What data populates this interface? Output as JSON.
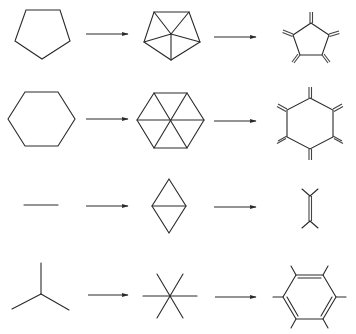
{
  "diagram": {
    "title": "",
    "stroke_color": "#2a2a2a",
    "rows": [
      {
        "label": "pentagon-row",
        "steps": [
          {
            "shape": "regular-pentagon",
            "orientation": "point-down"
          },
          {
            "shape": "pentagon-fan-triangulation",
            "orientation": "point-down",
            "triangles": 5
          },
          {
            "shape": "cyclopentane-pentaone",
            "orientation": "point-up",
            "substituents": 5,
            "substituent_type": "double-bond"
          }
        ]
      },
      {
        "label": "hexagon-row",
        "steps": [
          {
            "shape": "regular-hexagon",
            "orientation": "flat-top"
          },
          {
            "shape": "hexagon-fan-triangulation",
            "orientation": "flat-top",
            "triangles": 6
          },
          {
            "shape": "cyclohexane-hexaone",
            "orientation": "point-up",
            "substituents": 6,
            "substituent_type": "double-bond"
          }
        ]
      },
      {
        "label": "line-row",
        "steps": [
          {
            "shape": "line-segment",
            "orientation": "horizontal"
          },
          {
            "shape": "two-triangles-rhombus",
            "orientation": "vertical",
            "triangles": 2
          },
          {
            "shape": "ethylene",
            "orientation": "vertical",
            "bond": "double",
            "branches_per_end": 2
          }
        ]
      },
      {
        "label": "tripod-row",
        "steps": [
          {
            "shape": "three-spoke-star",
            "spokes": 3
          },
          {
            "shape": "six-spoke-star",
            "spokes": 6
          },
          {
            "shape": "benzene",
            "orientation": "flat-top",
            "double_bonds": [
              "top",
              "lower-left",
              "lower-right"
            ],
            "substituents": 6
          }
        ]
      }
    ],
    "arrows": [
      {
        "row": 0,
        "from": "step1",
        "to": "step2"
      },
      {
        "row": 0,
        "from": "step2",
        "to": "step3"
      },
      {
        "row": 1,
        "from": "step1",
        "to": "step2"
      },
      {
        "row": 1,
        "from": "step2",
        "to": "step3"
      },
      {
        "row": 2,
        "from": "step1",
        "to": "step2"
      },
      {
        "row": 2,
        "from": "step2",
        "to": "step3"
      },
      {
        "row": 3,
        "from": "step1",
        "to": "step2"
      },
      {
        "row": 3,
        "from": "step2",
        "to": "step3"
      }
    ]
  }
}
